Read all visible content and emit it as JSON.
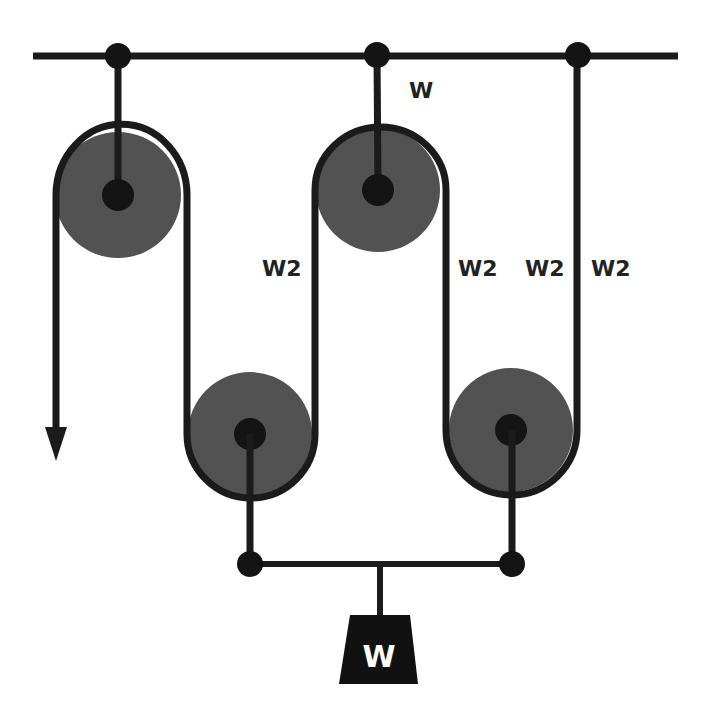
{
  "diagram": {
    "colors": {
      "background": "#ffffff",
      "rope": "#1b1b1b",
      "pulley_fill": "#525252",
      "hub": "#141414",
      "label": "#222222",
      "weight_fill": "#111111",
      "weight_text": "#ffffff"
    },
    "labels": {
      "top_hanger": "W",
      "left_inner": "W2",
      "middle_right": "W2",
      "right_inner": "W2",
      "right_outer": "W2",
      "weight": "W"
    },
    "pulleys": [
      {
        "name": "fixed-pulley-1",
        "type": "fixed",
        "cx": 118,
        "cy": 195
      },
      {
        "name": "fixed-pulley-2",
        "type": "fixed",
        "cx": 378,
        "cy": 190
      },
      {
        "name": "movable-pulley-1",
        "type": "movable",
        "cx": 250,
        "cy": 434
      },
      {
        "name": "movable-pulley-2",
        "type": "movable",
        "cx": 511,
        "cy": 430
      }
    ],
    "anchors": [
      {
        "name": "anchor-1",
        "x": 118,
        "y": 56
      },
      {
        "name": "anchor-2",
        "x": 377,
        "y": 55
      },
      {
        "name": "anchor-3",
        "x": 578,
        "y": 55
      }
    ],
    "pull_direction": "down"
  }
}
